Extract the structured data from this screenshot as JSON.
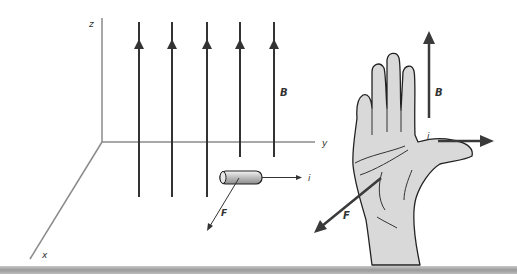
{
  "diagram": {
    "axes": {
      "x_label": "x",
      "y_label": "y",
      "z_label": "z"
    },
    "field": {
      "label": "B",
      "line_count": 5,
      "direction": "up (+z)"
    },
    "conductor": {
      "current_label": "i",
      "force_label": "F"
    },
    "hand": {
      "b_label": "B",
      "i_label": "i",
      "f_label": "F"
    },
    "colors": {
      "line": "#333333",
      "axis": "#8a8a8a",
      "hand_fill": "#d9d9d9",
      "arrow": "#3a3a3a"
    }
  }
}
